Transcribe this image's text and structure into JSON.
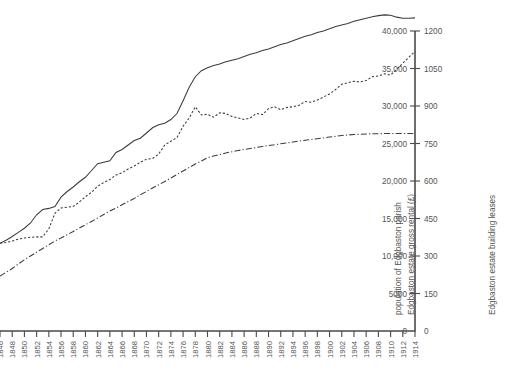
{
  "figure": {
    "background": "#ffffff",
    "ink_color": "#3c3c3c",
    "label_color": "#555555"
  },
  "chart_data": {
    "type": "line",
    "title": "",
    "subtitle": "",
    "xlabel": "",
    "grid": false,
    "legend": "none",
    "note": "Three series plotted against a common year axis; two stacked value axes are drawn on the right-hand side.",
    "x": [
      1846,
      1847,
      1848,
      1849,
      1850,
      1851,
      1852,
      1853,
      1854,
      1855,
      1856,
      1857,
      1858,
      1859,
      1860,
      1861,
      1862,
      1863,
      1864,
      1865,
      1866,
      1867,
      1868,
      1869,
      1870,
      1871,
      1872,
      1873,
      1874,
      1875,
      1876,
      1877,
      1878,
      1879,
      1880,
      1881,
      1882,
      1883,
      1884,
      1885,
      1886,
      1887,
      1888,
      1889,
      1890,
      1891,
      1892,
      1893,
      1894,
      1895,
      1896,
      1897,
      1898,
      1899,
      1900,
      1901,
      1902,
      1903,
      1904,
      1905,
      1906,
      1907,
      1908,
      1909,
      1910,
      1911,
      1912,
      1913,
      1914
    ],
    "xlim": [
      1846,
      1914
    ],
    "xticks": [
      1846,
      1848,
      1850,
      1852,
      1854,
      1856,
      1858,
      1860,
      1862,
      1864,
      1866,
      1868,
      1870,
      1872,
      1874,
      1876,
      1878,
      1880,
      1882,
      1884,
      1886,
      1888,
      1890,
      1892,
      1894,
      1896,
      1898,
      1900,
      1902,
      1904,
      1906,
      1908,
      1910,
      1912,
      1914
    ],
    "xtick_labels": [
      "1846",
      "1848",
      "1850",
      "1852",
      "1854",
      "1856",
      "1858",
      "1860",
      "1862",
      "1864",
      "1866",
      "1868",
      "1870",
      "1872",
      "1874",
      "1876",
      "1878",
      "1880",
      "1882",
      "1884",
      "1886",
      "1888",
      "1890",
      "1892",
      "1894",
      "1896",
      "1898",
      "1900",
      "1902",
      "1904",
      "1906",
      "1908",
      "1910",
      "1912",
      "1914"
    ],
    "axes": [
      {
        "id": "left-value-axis",
        "title": "population of Edgbaston parish",
        "ticks": [
          0,
          5000,
          10000,
          15000,
          20000,
          25000,
          30000,
          35000,
          40000
        ],
        "tick_labels": [
          "0",
          "5000",
          "10,000",
          "15,000",
          "20,000",
          "25,000",
          "30,000",
          "35,000",
          "40,000"
        ],
        "ylim": [
          0,
          42500
        ],
        "position": "right-inner"
      },
      {
        "id": "rental-axis",
        "title": "Edgbaston estate gross rental (£)",
        "ticks": [
          0,
          5000,
          10000,
          15000,
          20000,
          25000,
          30000,
          35000,
          40000
        ],
        "tick_labels": [
          "0",
          "5000",
          "10,000",
          "15,000",
          "20,000",
          "25,000",
          "30,000",
          "35,000",
          "40,000"
        ],
        "ylim": [
          0,
          42500
        ],
        "position": "right-inner"
      },
      {
        "id": "leases-axis",
        "title": "Edgbaston estate building leases",
        "ticks": [
          0,
          150,
          300,
          450,
          600,
          750,
          900,
          1050,
          1200
        ],
        "tick_labels": [
          "0",
          "150",
          "300",
          "450",
          "600",
          "750",
          "900",
          "1050",
          "1200"
        ],
        "ylim": [
          0,
          1275
        ],
        "position": "right-outer"
      }
    ],
    "series": [
      {
        "name": "population of Edgbaston parish",
        "style": "solid",
        "axis": "left-value-axis",
        "values": [
          11700,
          12100,
          12600,
          13150,
          13700,
          14400,
          15500,
          16200,
          16350,
          16600,
          17850,
          18600,
          19200,
          19900,
          20500,
          21400,
          22300,
          22500,
          22700,
          23800,
          24200,
          24800,
          25400,
          25700,
          26400,
          27100,
          27500,
          27700,
          28200,
          29000,
          30700,
          32500,
          33900,
          34700,
          35100,
          35400,
          35600,
          35900,
          36100,
          36300,
          36600,
          36900,
          37100,
          37400,
          37600,
          37900,
          38200,
          38400,
          38700,
          39000,
          39300,
          39500,
          39800,
          40000,
          40300,
          40600,
          40800,
          41000,
          41300,
          41500,
          41700,
          41900,
          42050,
          42150,
          42100,
          41850,
          41700,
          41700,
          41750
        ]
      },
      {
        "name": "Edgbaston estate gross rental (£)",
        "style": "dotted",
        "axis": "rental-axis",
        "values": [
          11700,
          11800,
          12000,
          12250,
          12400,
          12500,
          12550,
          12550,
          13600,
          15700,
          16400,
          16500,
          16600,
          17200,
          17900,
          18500,
          19300,
          19800,
          20200,
          20800,
          21100,
          21600,
          22000,
          22500,
          22900,
          23000,
          23600,
          24800,
          25300,
          25800,
          27300,
          28400,
          29900,
          28800,
          28900,
          28500,
          29100,
          29000,
          28600,
          28400,
          28200,
          28400,
          29000,
          28850,
          29650,
          29900,
          29500,
          29800,
          29900,
          30100,
          30600,
          30500,
          30800,
          31200,
          31600,
          32200,
          32900,
          33100,
          33300,
          33200,
          33400,
          33900,
          34000,
          34300,
          34100,
          34900,
          35700,
          36500,
          37300
        ]
      },
      {
        "name": "Edgbaston estate building leases",
        "style": "dash-dot",
        "axis": "leases-axis",
        "values": [
          220,
          235,
          250,
          268,
          285,
          300,
          315,
          330,
          345,
          360,
          372,
          385,
          398,
          412,
          425,
          438,
          452,
          466,
          480,
          492,
          505,
          518,
          530,
          545,
          558,
          572,
          585,
          598,
          612,
          626,
          640,
          654,
          668,
          680,
          693,
          700,
          706,
          712,
          717,
          722,
          726,
          730,
          734,
          738,
          742,
          745,
          749,
          752,
          756,
          760,
          763,
          766,
          769,
          772,
          776,
          779,
          782,
          784,
          786,
          787,
          788,
          789,
          789,
          790,
          790,
          790,
          790,
          790,
          790
        ]
      }
    ]
  },
  "geometry": {
    "plot_left": 0,
    "plot_right": 415,
    "baseline_y": 331,
    "value_top_y": 31,
    "value_top": 40000,
    "tick_step_px": 5.5
  },
  "ghost_text": {
    "top_fragment": ""
  }
}
